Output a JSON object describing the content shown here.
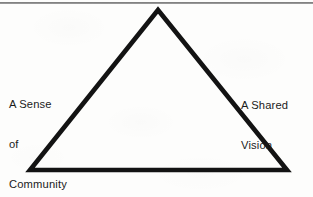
{
  "diagram": {
    "shape": "triangle",
    "stroke_color": "#131313",
    "background_color": "#fdfdfc",
    "text_color": "#1b1b1b",
    "rule_color": "#6f6f6f",
    "vertices": {
      "apex": [
        158,
        10
      ],
      "bottom_left": [
        30,
        170
      ],
      "bottom_right": [
        287,
        170
      ]
    },
    "labels": {
      "left": {
        "full_text": "A Sense of Community",
        "lines": [
          "A Sense",
          "of",
          "Community"
        ],
        "line1": "A Sense",
        "line2": "of",
        "line3": "Community"
      },
      "right": {
        "full_text": "A Shared Vision",
        "lines": [
          "A Shared",
          "Vision"
        ],
        "line1": "A Shared",
        "line2": "Vision"
      },
      "bottom": {
        "full_text": "A Positive Culture",
        "line1": "A Positive Culture"
      }
    }
  }
}
